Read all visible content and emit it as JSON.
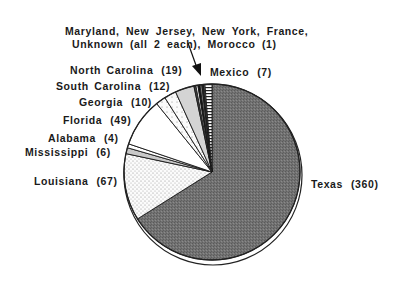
{
  "chart_data": {
    "type": "pie",
    "title": "",
    "start_angle": "12 o'clock, clockwise",
    "categories": [
      "Texas",
      "Louisiana",
      "Mississippi",
      "Alabama",
      "Florida",
      "Georgia",
      "South Carolina",
      "North Carolina",
      "Maryland",
      "New Jersey",
      "New York",
      "France",
      "Unknown",
      "Morocco",
      "Mexico"
    ],
    "values": [
      360,
      67,
      6,
      4,
      49,
      10,
      12,
      19,
      2,
      2,
      2,
      2,
      2,
      1,
      7
    ],
    "labels": {
      "texas": {
        "name": "Texas",
        "value": "(360)"
      },
      "louisiana": {
        "name": "Louisiana",
        "value": "(67)"
      },
      "mississippi": {
        "name": "Mississippi",
        "value": "(6)"
      },
      "alabama": {
        "name": "Alabama",
        "value": "(4)"
      },
      "florida": {
        "name": "Florida",
        "value": "(49)"
      },
      "georgia": {
        "name": "Georgia",
        "value": "(10)"
      },
      "south_carolina": {
        "name": "South Carolina",
        "value": "(12)"
      },
      "north_carolina": {
        "name": "North Carolina",
        "value": "(19)"
      },
      "mexico": {
        "name": "Mexico",
        "value": "(7)"
      }
    },
    "annotation": {
      "line1": "Maryland, New Jersey, New York, France,",
      "line2": "Unknown (all 2 each), Morocco (1)"
    },
    "fills": {
      "texas": "#7a7a7a",
      "louisiana": "#f0f0f0",
      "mississippi": "#c8c8c8",
      "alabama": "#ffffff",
      "florida": "#ffffff",
      "georgia": "#f2f2f2",
      "south_carolina": "#ececec",
      "north_carolina": "#d0d0d0",
      "small": "#1e1e1e",
      "mexico": "#ffffff"
    },
    "legend": "none (direct labels)"
  }
}
